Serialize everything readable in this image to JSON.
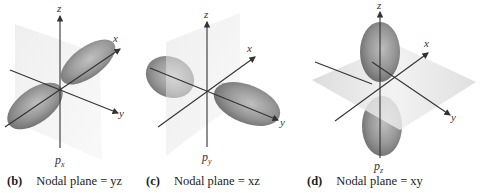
{
  "panels": [
    {
      "id": "b",
      "tag": "(b)",
      "caption": "Nodal plane = yz",
      "orbital": "p",
      "orbital_sub": "x",
      "axes": {
        "x": "x",
        "y": "y",
        "z": "z"
      }
    },
    {
      "id": "c",
      "tag": "(c)",
      "caption": "Nodal plane = xz",
      "orbital": "p",
      "orbital_sub": "y",
      "axes": {
        "x": "x",
        "y": "y",
        "z": "z"
      }
    },
    {
      "id": "d",
      "tag": "(d)",
      "caption": "Nodal plane = xy",
      "orbital": "p",
      "orbital_sub": "z",
      "axes": {
        "x": "x",
        "y": "y",
        "z": "z"
      }
    }
  ],
  "colors": {
    "lobe": "#7a7a7a",
    "plane": "#e6e6e6",
    "axis": "#333333"
  }
}
